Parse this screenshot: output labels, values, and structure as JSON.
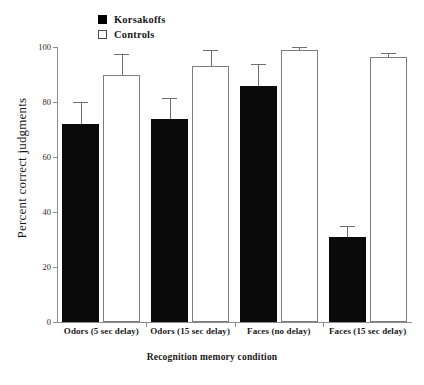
{
  "chart_data": {
    "type": "bar",
    "title": "",
    "xlabel": "Recognition memory condition",
    "ylabel": "Percent correct judgments",
    "categories": [
      "Odors (5 sec delay)",
      "Odors (15 sec delay)",
      "Faces (no delay)",
      "Faces (15 sec delay)"
    ],
    "series": [
      {
        "name": "Korsakoffs",
        "color": "#000000",
        "style": "filled",
        "values": [
          72,
          74,
          86,
          31
        ],
        "errors": [
          8,
          7.5,
          8,
          4
        ]
      },
      {
        "name": "Controls",
        "color": "#ffffff",
        "style": "open",
        "values": [
          90,
          93,
          99,
          96.5
        ],
        "errors": [
          7.5,
          6,
          1,
          1.5
        ]
      }
    ],
    "ylim": [
      0,
      100
    ],
    "yticks": [
      0,
      20,
      40,
      60,
      80,
      100
    ],
    "ytick_labels": [
      "0",
      "20",
      "40",
      "60",
      "80",
      "100"
    ],
    "grid": false,
    "legend_position": "top-left",
    "error_bar_type": "upper-only"
  },
  "legend": {
    "entries": [
      {
        "label": "Korsakoffs",
        "swatch": "filled-square"
      },
      {
        "label": "Controls",
        "swatch": "open-square"
      }
    ]
  }
}
